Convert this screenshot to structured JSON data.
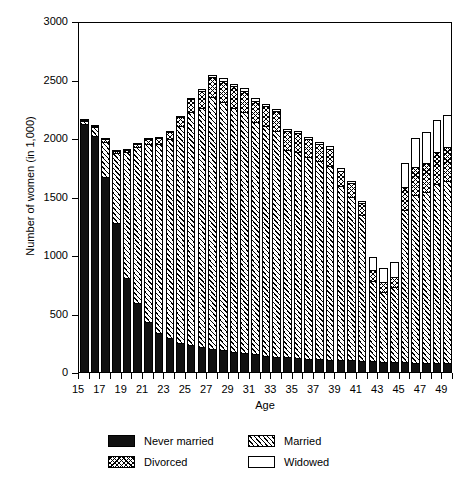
{
  "chart_data": {
    "type": "bar",
    "stacked": true,
    "title": "",
    "xlabel": "Age",
    "ylabel": "Number of women (in 1,000)",
    "ylim": [
      0,
      3000
    ],
    "yticks": [
      0,
      500,
      1000,
      1500,
      2000,
      2500,
      3000
    ],
    "xlim": [
      15,
      50
    ],
    "xticks": [
      15,
      16,
      17,
      18,
      19,
      20,
      21,
      22,
      23,
      24,
      25,
      26,
      27,
      28,
      29,
      30,
      31,
      32,
      33,
      34,
      35,
      36,
      37,
      38,
      39,
      40,
      41,
      42,
      43,
      44,
      45,
      46,
      47,
      48,
      49,
      50
    ],
    "xtick_labels_shown": [
      15,
      17,
      19,
      21,
      23,
      25,
      27,
      29,
      31,
      33,
      35,
      37,
      39,
      41,
      43,
      45,
      47,
      49
    ],
    "grid": false,
    "legend_position": "below",
    "categories": [
      16,
      17,
      18,
      19,
      20,
      21,
      22,
      23,
      24,
      25,
      26,
      27,
      28,
      29,
      30,
      31,
      32,
      33,
      34,
      35,
      36,
      37,
      38,
      39,
      40,
      41,
      42,
      43,
      44,
      45,
      46,
      47,
      48,
      49,
      50
    ],
    "series": [
      {
        "name": "Never married",
        "fill": "solid-black",
        "values": [
          2120,
          2020,
          1670,
          1270,
          800,
          590,
          430,
          330,
          290,
          250,
          230,
          210,
          200,
          190,
          175,
          160,
          150,
          140,
          130,
          125,
          120,
          115,
          110,
          105,
          100,
          100,
          95,
          90,
          85,
          85,
          85,
          80,
          80,
          80,
          80
        ]
      },
      {
        "name": "Married",
        "fill": "diagonal-hatch",
        "values": [
          25,
          70,
          300,
          600,
          1080,
          1330,
          1520,
          1620,
          1700,
          1850,
          1990,
          2050,
          2150,
          2120,
          2080,
          2060,
          1990,
          1960,
          1930,
          1770,
          1760,
          1720,
          1690,
          1660,
          1490,
          1400,
          1250,
          690,
          600,
          640,
          1300,
          1430,
          1460,
          1530,
          1550
        ]
      },
      {
        "name": "Divorced",
        "fill": "cross-hatch",
        "values": [
          10,
          10,
          20,
          20,
          20,
          30,
          40,
          50,
          60,
          80,
          110,
          140,
          170,
          180,
          190,
          185,
          180,
          175,
          170,
          165,
          160,
          155,
          150,
          145,
          130,
          115,
          100,
          90,
          85,
          90,
          200,
          240,
          250,
          270,
          290
        ]
      },
      {
        "name": "Widowed",
        "fill": "white",
        "values": [
          5,
          5,
          10,
          10,
          10,
          10,
          10,
          10,
          10,
          10,
          15,
          15,
          15,
          20,
          20,
          20,
          20,
          20,
          20,
          20,
          20,
          20,
          20,
          20,
          20,
          20,
          20,
          110,
          115,
          125,
          200,
          250,
          260,
          270,
          280
        ]
      }
    ],
    "totals": [
      2160,
      2105,
      2000,
      1900,
      1910,
      1960,
      2000,
      2010,
      2060,
      2190,
      2345,
      2415,
      2535,
      2510,
      2465,
      2425,
      2340,
      2295,
      2250,
      2080,
      2060,
      2010,
      1970,
      1930,
      1740,
      1635,
      1465,
      980,
      885,
      940,
      1785,
      2000,
      2050,
      2150,
      2200
    ]
  },
  "axes": {
    "ylabel": "Number of women (in 1,000)",
    "xlabel": "Age",
    "ytick_labels": [
      "0",
      "500",
      "1000",
      "1500",
      "2000",
      "2500",
      "3000"
    ],
    "xtick_labels": [
      "15",
      "17",
      "19",
      "21",
      "23",
      "25",
      "27",
      "29",
      "31",
      "33",
      "35",
      "37",
      "39",
      "41",
      "43",
      "45",
      "47",
      "49"
    ]
  },
  "legend": {
    "entries": [
      {
        "label": "Never married",
        "fill": "solid-black"
      },
      {
        "label": "Married",
        "fill": "diagonal-hatch"
      },
      {
        "label": "Divorced",
        "fill": "cross-hatch"
      },
      {
        "label": "Widowed",
        "fill": "white"
      }
    ]
  },
  "colors": {
    "ink": "#000000",
    "background": "#ffffff"
  }
}
